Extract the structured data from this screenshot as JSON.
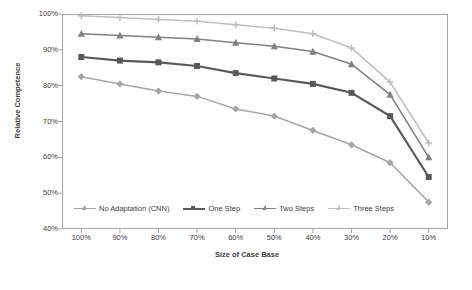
{
  "chart_data": {
    "type": "line",
    "title": "",
    "xlabel": "Size of Case Base",
    "ylabel": "Relative Competence",
    "categories": [
      "100%",
      "90%",
      "80%",
      "70%",
      "60%",
      "50%",
      "40%",
      "30%",
      "20%",
      "10%"
    ],
    "yticks": [
      "100%",
      "90%",
      "80%",
      "70%",
      "60%",
      "50%",
      "40%"
    ],
    "ylim": [
      40,
      100
    ],
    "grid": false,
    "legend_position": "bottom-inside",
    "series": [
      {
        "name": "No Adaptation (CNN)",
        "color": "#a6a6a6",
        "marker": "diamond",
        "values": [
          82.5,
          80.5,
          78.5,
          77.0,
          73.5,
          71.5,
          67.5,
          63.5,
          58.5,
          47.5
        ]
      },
      {
        "name": "One Step",
        "color": "#595959",
        "marker": "square",
        "values": [
          88.0,
          87.0,
          86.5,
          85.5,
          83.5,
          82.0,
          80.5,
          78.0,
          71.5,
          54.5
        ]
      },
      {
        "name": "Two Steps",
        "color": "#808080",
        "marker": "triangle",
        "values": [
          94.5,
          94.0,
          93.5,
          93.0,
          92.0,
          91.0,
          89.5,
          86.0,
          77.5,
          60.0
        ]
      },
      {
        "name": "Three Steps",
        "color": "#bfbfbf",
        "marker": "cross",
        "values": [
          99.5,
          99.0,
          98.5,
          98.0,
          97.0,
          96.0,
          94.5,
          90.5,
          81.0,
          64.0
        ]
      }
    ]
  }
}
